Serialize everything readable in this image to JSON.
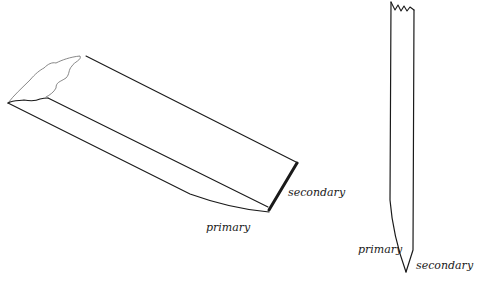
{
  "diagram": {
    "figures": [
      {
        "id": "angled-blade",
        "labels": {
          "primary": "primary",
          "secondary": "secondary"
        }
      },
      {
        "id": "vertical-blade",
        "labels": {
          "primary": "primary",
          "secondary": "secondary"
        }
      }
    ]
  }
}
